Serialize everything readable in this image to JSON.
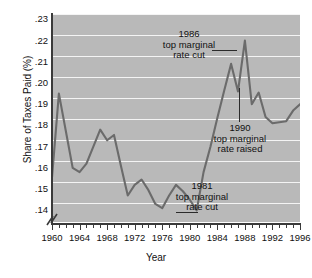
{
  "chart_data": {
    "type": "line",
    "title": "",
    "xlabel": "Year",
    "ylabel": "Share of Taxes Paid (%)",
    "xlim": [
      1960,
      1996
    ],
    "ylim": [
      0.1345,
      0.2325
    ],
    "grid": true,
    "legend": null,
    "y_ticks": [
      0.14,
      0.15,
      0.16,
      0.17,
      0.18,
      0.19,
      0.2,
      0.21,
      0.22,
      0.23
    ],
    "y_tick_labels": [
      ".14",
      ".15",
      ".16",
      ".17",
      ".18",
      ".19",
      ".20",
      ".21",
      ".22",
      ".23"
    ],
    "y_axis_break": true,
    "x_ticks_major": [
      1960,
      1964,
      1968,
      1972,
      1976,
      1980,
      1984,
      1988,
      1992,
      1996
    ],
    "x_tick_labels": [
      "1960",
      "1964",
      "1968",
      "1972",
      "1976",
      "1980",
      "1984",
      "1988",
      "1992",
      "1996"
    ],
    "x_minor_tick_interval": 1,
    "series": [
      {
        "name": "Share of Taxes Paid",
        "color": "#6b6b6b",
        "x": [
          1960,
          1961,
          1962,
          1963,
          1964,
          1965,
          1966,
          1967,
          1968,
          1969,
          1970,
          1971,
          1972,
          1973,
          1974,
          1975,
          1976,
          1977,
          1978,
          1979,
          1980,
          1981,
          1982,
          1983,
          1984,
          1985,
          1986,
          1987,
          1988,
          1989,
          1990,
          1991,
          1992,
          1993,
          1994,
          1995,
          1996
        ],
        "y": [
          0.1555,
          0.195,
          0.1775,
          0.16,
          0.158,
          0.162,
          0.17,
          0.178,
          0.173,
          0.1755,
          0.161,
          0.147,
          0.152,
          0.1545,
          0.1495,
          0.143,
          0.141,
          0.147,
          0.152,
          0.149,
          0.145,
          0.14,
          0.158,
          0.17,
          0.1835,
          0.1965,
          0.209,
          0.196,
          0.22,
          0.19,
          0.1955,
          0.184,
          0.181,
          0.1815,
          0.182,
          0.187,
          0.19
        ]
      }
    ],
    "annotations": [
      {
        "id": "anno-1986",
        "lines": [
          "1986",
          "top marginal",
          "rate cut"
        ],
        "points_to_year": 1986,
        "points_to_value": 0.209
      },
      {
        "id": "anno-1990",
        "lines": [
          "1990",
          "top marginal",
          "rate raised"
        ],
        "points_to_year": 1990,
        "points_to_value": 0.1955
      },
      {
        "id": "anno-1981",
        "lines": [
          "1981",
          "top marginal",
          "rate cut"
        ],
        "points_to_year": 1981,
        "points_to_value": 0.14
      }
    ],
    "colors": {
      "plot_background": "#b9b9b9",
      "gridline": "#f4f4f4",
      "line": "#6b6b6b",
      "axis": "#3a3a3a",
      "text": "#111111",
      "page_background": "#ffffff"
    }
  }
}
